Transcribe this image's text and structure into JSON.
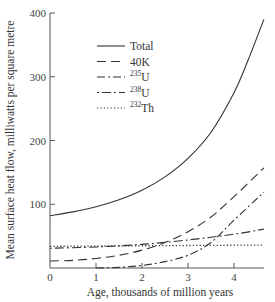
{
  "chart_data": {
    "type": "line",
    "title": "",
    "xlabel": "Age, thousands of million years",
    "ylabel": "Mean surface heat flow, milliwatts per square metre",
    "xlim": [
      0,
      4.65
    ],
    "ylim": [
      0,
      400
    ],
    "xticks": [
      0,
      1,
      2,
      3,
      4
    ],
    "yticks": [
      100,
      200,
      300,
      400
    ],
    "xtick_labels": [
      "0",
      "1",
      "2",
      "3",
      "4"
    ],
    "ytick_labels": [
      "100",
      "200",
      "300",
      "400"
    ],
    "grid": false,
    "legend_position": "upper center",
    "series": [
      {
        "name": "Total",
        "isotope_mass": "",
        "element": "Total",
        "style": "solid",
        "x": [
          0,
          0.5,
          1,
          1.5,
          2,
          2.5,
          3,
          3.5,
          4,
          4.3,
          4.65
        ],
        "y": [
          82,
          88,
          96,
          107,
          122,
          143,
          172,
          213,
          275,
          325,
          390
        ]
      },
      {
        "name": "40K",
        "isotope_mass": "",
        "element": "40K",
        "style": "long-dash",
        "x": [
          0,
          0.5,
          1,
          1.5,
          2,
          2.5,
          3,
          3.5,
          4,
          4.65
        ],
        "y": [
          11,
          12,
          15,
          20,
          28,
          40,
          57,
          80,
          112,
          157
        ]
      },
      {
        "name": "235U",
        "isotope_mass": "235",
        "element": "U",
        "style": "dash-dot",
        "x": [
          1,
          1.5,
          2,
          2.5,
          3,
          3.5,
          4,
          4.65
        ],
        "y": [
          0,
          1,
          4,
          10,
          20,
          40,
          75,
          119
        ]
      },
      {
        "name": "238U",
        "isotope_mass": "238",
        "element": "U",
        "style": "dot-dash-long",
        "x": [
          0,
          1,
          2,
          3,
          4,
          4.65
        ],
        "y": [
          31,
          33,
          37,
          44,
          53,
          61
        ]
      },
      {
        "name": "232Th",
        "isotope_mass": "232",
        "element": "Th",
        "style": "dotted",
        "x": [
          0,
          4.65
        ],
        "y": [
          34,
          36
        ]
      }
    ]
  }
}
